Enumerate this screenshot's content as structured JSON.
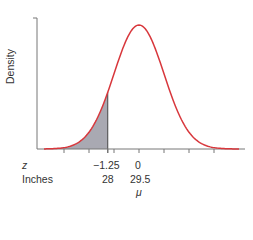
{
  "chart_data": {
    "type": "area",
    "title": "",
    "ylabel": "Density",
    "xlabel_rows": [
      {
        "name": "z",
        "ticks": [
          {
            "value": "-1.25",
            "z": -1.25
          },
          {
            "value": "0",
            "z": 0
          }
        ]
      },
      {
        "name": "Inches",
        "ticks": [
          {
            "value": "28",
            "z": -1.25
          },
          {
            "value": "29.5",
            "z": 0
          }
        ]
      }
    ],
    "mean_symbol": "μ",
    "distribution": {
      "kind": "normal",
      "mean_inches": 29.5,
      "sd_inches": 1.2
    },
    "shaded_region": {
      "from_z": "-inf",
      "to_z": -1.25,
      "description": "P(Z < -1.25)"
    },
    "x_ticks_z": [
      -3,
      -2,
      -1.25,
      -1,
      0,
      1,
      2,
      3
    ],
    "x_range_z": [
      -3.8,
      4
    ],
    "grid": false,
    "legend": null,
    "colors": {
      "curve": "#d8373c",
      "fill": "#a9a9b2",
      "axis": "#666666"
    }
  },
  "labels": {
    "z_row": "z",
    "inches_row": "Inches",
    "z_neg": "−1.25",
    "z_zero": "0",
    "in_28": "28",
    "in_mean": "29.5",
    "mu": "μ",
    "ylabel": "Density"
  }
}
